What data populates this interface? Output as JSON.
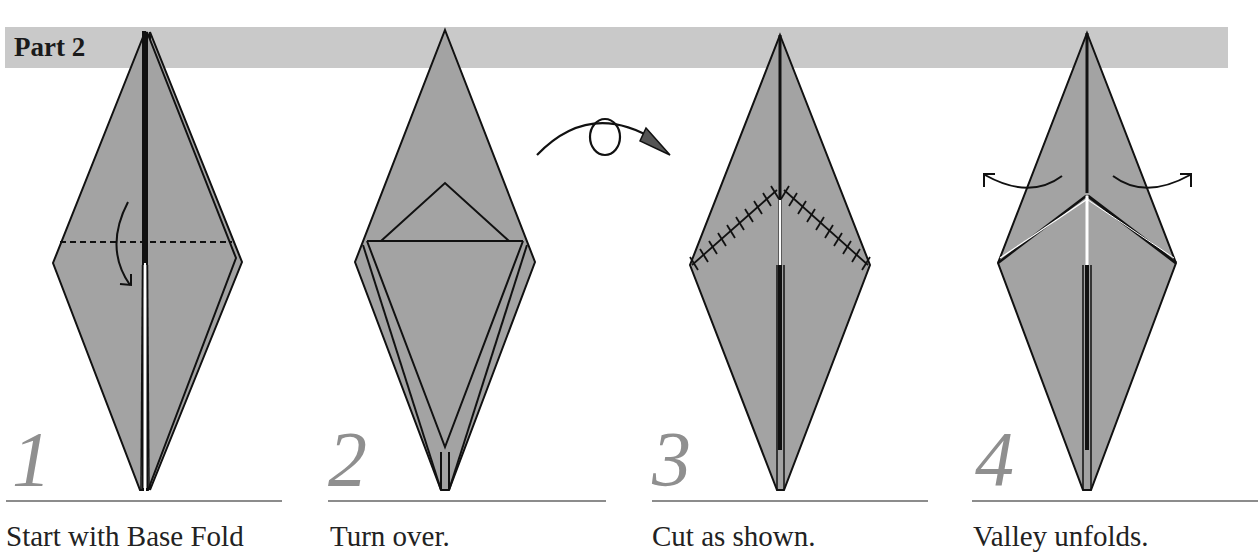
{
  "header": {
    "title": "Part 2",
    "bar_color": "#c9c9c9"
  },
  "colors": {
    "paper": "#a3a3a3",
    "outline": "#111111",
    "number": "#8f8f8f",
    "rule": "#8c8c8c"
  },
  "steps": [
    {
      "number": "1",
      "caption": "Start with Base Fold",
      "symbols": [
        "valley-fold-line",
        "fold-down-arrow"
      ]
    },
    {
      "number": "2",
      "caption": "Turn over.",
      "symbols": [
        "turn-over-arrow"
      ]
    },
    {
      "number": "3",
      "caption": "Cut as shown.",
      "symbols": [
        "cut-lines"
      ]
    },
    {
      "number": "4",
      "caption": "Valley unfolds.",
      "symbols": [
        "unfold-left-arrow",
        "unfold-right-arrow"
      ]
    }
  ]
}
